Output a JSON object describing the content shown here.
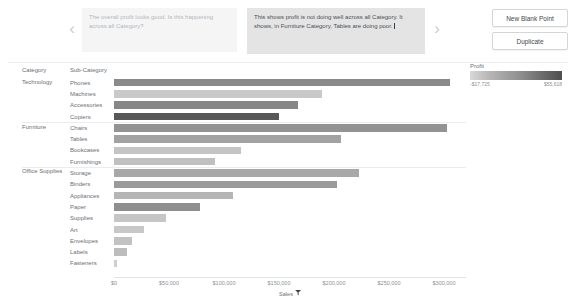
{
  "story": {
    "prev_icon": "chevron-left-icon",
    "next_icon": "chevron-right-icon",
    "points": [
      {
        "caption": "The overall profit looks good. Is this happening across all Category?",
        "selected": false
      },
      {
        "caption": "This shows profit is not doing well across all Category. It shows, in Furniture Category, Tables are doing poor.",
        "selected": true
      }
    ],
    "buttons": {
      "new_blank_point": "New Blank Point",
      "duplicate": "Duplicate"
    }
  },
  "sheet": {
    "header_category": "Category",
    "header_subcategory": "Sub-Category"
  },
  "legend": {
    "title": "Profit",
    "min_label": "-$17,725",
    "max_label": "$55,618",
    "ramp_low_color": "#d8d8d8",
    "ramp_high_color": "#4f4f4f"
  },
  "chart_data": {
    "type": "bar",
    "title": "",
    "xlabel": "Sales",
    "ylabel": "Sub-Category",
    "orientation": "horizontal",
    "xlim": [
      0,
      320000
    ],
    "xticks": [
      "$0",
      "$50,000",
      "$100,000",
      "$150,000",
      "$200,000",
      "$250,000",
      "$300,000"
    ],
    "xtick_values": [
      0,
      50000,
      100000,
      150000,
      200000,
      250000,
      300000
    ],
    "grid": false,
    "legend_position": "top-right",
    "color_encoding": "Profit",
    "sort_icon": "sort-descending-icon",
    "groups": [
      {
        "category": "Technology",
        "rows": [
          {
            "subcategory": "Phones",
            "sales": 305000,
            "profit": 44516,
            "color": "#8a8a8a"
          },
          {
            "subcategory": "Machines",
            "sales": 189000,
            "profit": 3385,
            "color": "#c9c9c9"
          },
          {
            "subcategory": "Accessories",
            "sales": 167000,
            "profit": 41937,
            "color": "#878787"
          },
          {
            "subcategory": "Copiers",
            "sales": 150000,
            "profit": 55618,
            "color": "#585858"
          }
        ]
      },
      {
        "category": "Furniture",
        "rows": [
          {
            "subcategory": "Chairs",
            "sales": 303000,
            "profit": 26590,
            "color": "#939393"
          },
          {
            "subcategory": "Tables",
            "sales": 206000,
            "profit": -17725,
            "color": "#a2a2a2"
          },
          {
            "subcategory": "Bookcases",
            "sales": 115000,
            "profit": -3473,
            "color": "#c4c4c4"
          },
          {
            "subcategory": "Furnishings",
            "sales": 92000,
            "profit": 13059,
            "color": "#c0c0c0"
          }
        ]
      },
      {
        "category": "Office Supplies",
        "rows": [
          {
            "subcategory": "Storage",
            "sales": 223000,
            "profit": 21279,
            "color": "#a8a8a8"
          },
          {
            "subcategory": "Binders",
            "sales": 203000,
            "profit": 30222,
            "color": "#9a9a9a"
          },
          {
            "subcategory": "Appliances",
            "sales": 108000,
            "profit": 18138,
            "color": "#b5b5b5"
          },
          {
            "subcategory": "Paper",
            "sales": 78000,
            "profit": 34054,
            "color": "#8f8f8f"
          },
          {
            "subcategory": "Supplies",
            "sales": 47000,
            "profit": -1189,
            "color": "#c6c6c6"
          },
          {
            "subcategory": "Art",
            "sales": 27000,
            "profit": 6528,
            "color": "#c8c8c8"
          },
          {
            "subcategory": "Envelopes",
            "sales": 16000,
            "profit": 6964,
            "color": "#c2c2c2"
          },
          {
            "subcategory": "Labels",
            "sales": 12000,
            "profit": 5546,
            "color": "#bdbdbd"
          },
          {
            "subcategory": "Fasteners",
            "sales": 3000,
            "profit": 950,
            "color": "#cfcfcf"
          }
        ]
      }
    ]
  }
}
